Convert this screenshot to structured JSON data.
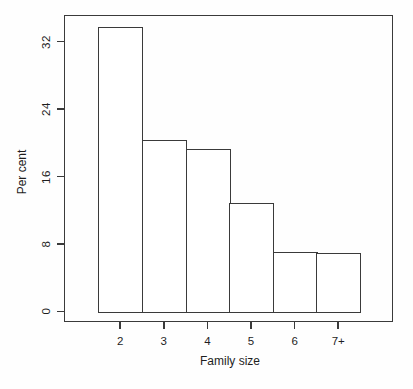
{
  "chart_data": {
    "type": "bar",
    "title": "",
    "xlabel": "Family size",
    "ylabel": "Per cent",
    "categories": [
      "2",
      "3",
      "4",
      "5",
      "6",
      "7+"
    ],
    "values": [
      33.7,
      20.3,
      19.3,
      12.8,
      7.0,
      6.9
    ],
    "yticks": [
      0,
      8,
      16,
      24,
      32
    ],
    "ylim": [
      0,
      35.5
    ],
    "grid": false,
    "legend": "none",
    "bar_fill": "#ffffff",
    "stroke_color": "#3a3a3a",
    "bars_touching": true,
    "y_tick_labels_rotated": true
  }
}
